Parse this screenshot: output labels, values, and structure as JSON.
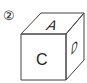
{
  "figure": {
    "number_label": "②",
    "cube": {
      "top_face": "A",
      "front_face": "C",
      "right_face": "D"
    },
    "colors": {
      "line": "#444444",
      "text": "#222222",
      "background": "#ffffff"
    }
  }
}
